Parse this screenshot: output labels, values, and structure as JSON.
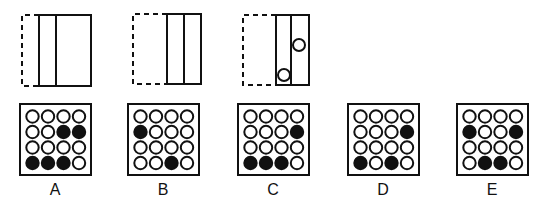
{
  "puzzle": {
    "question_figures": [
      {
        "id": "fig1",
        "dashed_left_x": 22,
        "solid": {
          "x": 39,
          "y": 15,
          "w": 52,
          "h": 71
        },
        "inner_line_x": 56,
        "dashed_box": {
          "x": 22,
          "y": 15,
          "w": 17,
          "h": 71
        },
        "circles": []
      },
      {
        "id": "fig2",
        "solid": {
          "x": 167,
          "y": 14,
          "w": 34,
          "h": 70
        },
        "inner_line_x": 184,
        "dashed_box": {
          "x": 133,
          "y": 14,
          "w": 34,
          "h": 70
        },
        "circles": []
      },
      {
        "id": "fig3",
        "solid": {
          "x": 276,
          "y": 15,
          "w": 33,
          "h": 70
        },
        "inner_line_x": 291,
        "dashed_box": {
          "x": 243,
          "y": 15,
          "w": 33,
          "h": 70
        },
        "circles": [
          {
            "cx": 299,
            "cy": 45,
            "r": 6
          },
          {
            "cx": 284,
            "cy": 75,
            "r": 6
          }
        ]
      }
    ],
    "options": [
      {
        "label": "A",
        "x": 20,
        "grid": [
          [
            0,
            0,
            0,
            0
          ],
          [
            0,
            0,
            1,
            1
          ],
          [
            0,
            0,
            0,
            0
          ],
          [
            1,
            1,
            1,
            0
          ]
        ]
      },
      {
        "label": "B",
        "x": 128,
        "grid": [
          [
            0,
            0,
            0,
            0
          ],
          [
            1,
            0,
            0,
            0
          ],
          [
            0,
            0,
            0,
            0
          ],
          [
            0,
            0,
            1,
            0
          ]
        ]
      },
      {
        "label": "C",
        "x": 238,
        "grid": [
          [
            0,
            0,
            0,
            0
          ],
          [
            0,
            0,
            0,
            1
          ],
          [
            0,
            0,
            0,
            0
          ],
          [
            1,
            1,
            1,
            0
          ]
        ]
      },
      {
        "label": "D",
        "x": 348,
        "grid": [
          [
            0,
            0,
            0,
            0
          ],
          [
            0,
            0,
            0,
            1
          ],
          [
            0,
            0,
            0,
            0
          ],
          [
            1,
            0,
            1,
            0
          ]
        ]
      },
      {
        "label": "E",
        "x": 457,
        "grid": [
          [
            0,
            0,
            0,
            0
          ],
          [
            1,
            0,
            0,
            1
          ],
          [
            0,
            0,
            0,
            0
          ],
          [
            0,
            1,
            1,
            0
          ]
        ]
      }
    ],
    "option_box": {
      "y": 104,
      "size": 71
    },
    "colors": {
      "line": "#111111",
      "filled": "#111111",
      "empty": "#ffffff",
      "background": "#ffffff"
    }
  }
}
